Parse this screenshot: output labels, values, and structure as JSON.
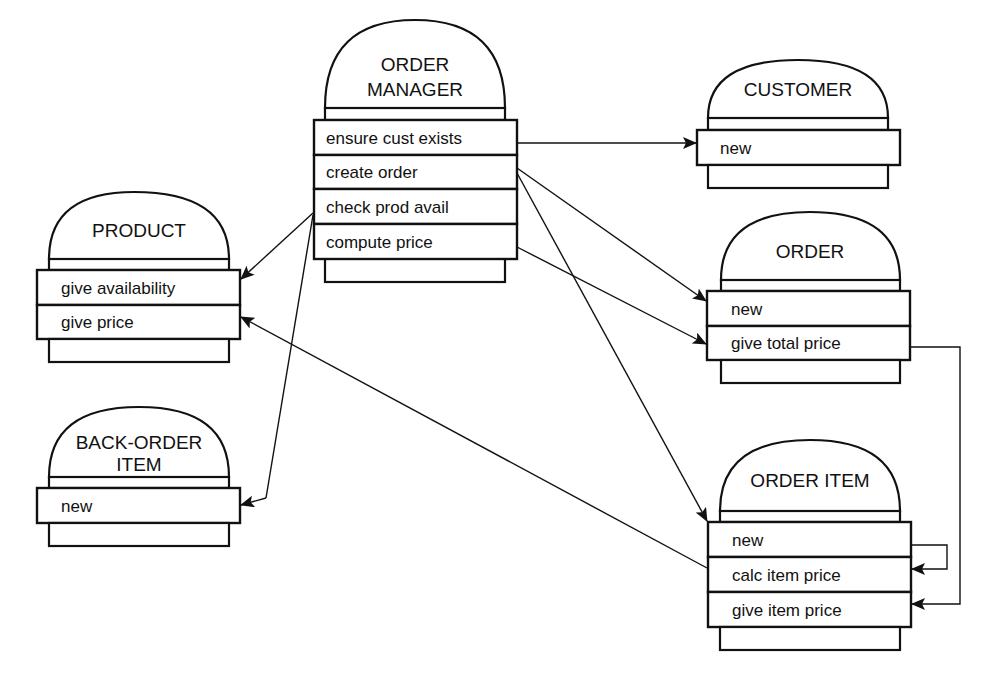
{
  "diagram": {
    "objects": {
      "order_manager": {
        "title_lines": [
          "ORDER",
          "MANAGER"
        ],
        "methods": [
          "ensure cust exists",
          "create order",
          "check prod avail",
          "compute price"
        ]
      },
      "customer": {
        "title_lines": [
          "CUSTOMER"
        ],
        "methods": [
          "new"
        ]
      },
      "order": {
        "title_lines": [
          "ORDER"
        ],
        "methods": [
          "new",
          "give total price"
        ]
      },
      "product": {
        "title_lines": [
          "PRODUCT"
        ],
        "methods": [
          "give availability",
          "give price"
        ]
      },
      "back_order_item": {
        "title_lines": [
          "BACK-ORDER",
          "ITEM"
        ],
        "methods": [
          "new"
        ]
      },
      "order_item": {
        "title_lines": [
          "ORDER ITEM"
        ],
        "methods": [
          "new",
          "calc item price",
          "give item price"
        ]
      }
    },
    "messages": [
      {
        "from": "order_manager.ensure cust exists",
        "to": "customer.new"
      },
      {
        "from": "order_manager.create order",
        "to": "order.new"
      },
      {
        "from": "order_manager.create order",
        "to": "order_item.new"
      },
      {
        "from": "order_manager.check prod avail",
        "to": "product.give availability"
      },
      {
        "from": "order_manager.check prod avail",
        "to": "back_order_item.new"
      },
      {
        "from": "order_manager.compute price",
        "to": "order.give total price"
      },
      {
        "from": "order.give total price",
        "to": "order_item.give item price"
      },
      {
        "from": "order_item.new",
        "to": "order_item.calc item price"
      },
      {
        "from": "order_item.calc item price",
        "to": "product.give price"
      }
    ],
    "colors": {
      "ink": "#111111",
      "background": "#ffffff"
    }
  }
}
